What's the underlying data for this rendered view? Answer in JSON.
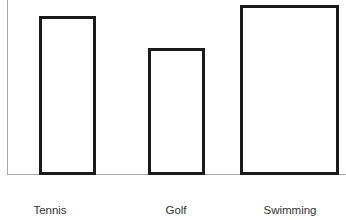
{
  "chart_data": {
    "type": "bar",
    "title": "",
    "xlabel": "",
    "ylabel": "",
    "categories": [
      "Tennis",
      "Golf",
      "Swimming"
    ],
    "values": [
      159,
      127,
      170
    ],
    "ylim": [
      0,
      175
    ],
    "grid": false,
    "legend": null,
    "bars": [
      {
        "label": "Tennis",
        "value": 159,
        "x": 39,
        "width": 57,
        "height": 159,
        "label_center": 50
      },
      {
        "label": "Golf",
        "value": 127,
        "x": 148,
        "width": 57,
        "height": 127,
        "label_center": 176
      },
      {
        "label": "Swimming",
        "value": 170,
        "x": 240,
        "width": 99,
        "height": 170,
        "label_center": 290
      }
    ],
    "colors": {
      "bar_fill": "#ffffff",
      "bar_stroke": "#1b1b1b",
      "axis": "#a8a8a8",
      "label_text": "#333333",
      "background": "#ffffff"
    }
  }
}
